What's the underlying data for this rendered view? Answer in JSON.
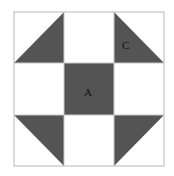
{
  "diagram": {
    "type": "quilt-block",
    "grid": "3x3",
    "colors": {
      "dark": "#545454",
      "light": "#ffffff",
      "line": "#b8b8b8"
    },
    "labels": {
      "center": "A",
      "triangle": "C"
    }
  }
}
